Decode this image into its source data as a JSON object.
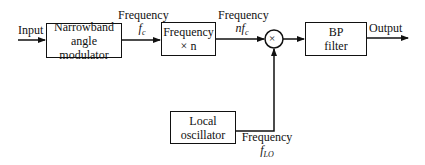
{
  "diagram": {
    "type": "block-diagram",
    "title": "",
    "input_label": "Input",
    "output_label": "Output",
    "blocks": [
      {
        "id": "modulator",
        "line1": "Narrowband",
        "line2": "angle modulator"
      },
      {
        "id": "multiplier",
        "line1": "Frequency",
        "line2": "× n"
      },
      {
        "id": "bpfilter",
        "line1": "BP",
        "line2": "filter"
      },
      {
        "id": "oscillator",
        "line1": "Local",
        "line2": "oscillator"
      }
    ],
    "mixer": {
      "symbol": "×"
    },
    "signals": [
      {
        "id": "fc",
        "line1": "Frequency",
        "line2": "f_c",
        "display": "fc"
      },
      {
        "id": "nfc",
        "line1": "Frequency",
        "line2": "nf_c",
        "display": "nfc"
      },
      {
        "id": "flo",
        "line1": "Frequency",
        "line2": "f_LO",
        "display": "fLO"
      }
    ],
    "connections": [
      [
        "Input",
        "modulator"
      ],
      [
        "modulator",
        "multiplier"
      ],
      [
        "multiplier",
        "mixer"
      ],
      [
        "oscillator",
        "mixer"
      ],
      [
        "mixer",
        "bpfilter"
      ],
      [
        "bpfilter",
        "Output"
      ]
    ]
  }
}
